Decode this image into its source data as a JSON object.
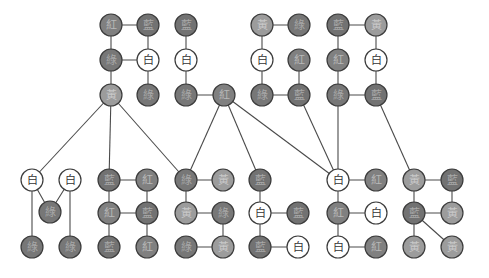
{
  "diagram": {
    "title": "",
    "palette": {
      "白": {
        "fill": "#ffffff",
        "text": "#333333"
      },
      "紅": {
        "fill": "#808080",
        "text": "#b8b8b8"
      },
      "藍": {
        "fill": "#727272",
        "text": "#a8a8a8"
      },
      "綠": {
        "fill": "#777777",
        "text": "#a8a8a8"
      },
      "黃": {
        "fill": "#9c9c9c",
        "text": "#c8c8c8"
      }
    },
    "nodes": [
      {
        "id": "a1",
        "label": "紅",
        "x": 111,
        "y": 25
      },
      {
        "id": "a2",
        "label": "藍",
        "x": 148,
        "y": 25
      },
      {
        "id": "a3",
        "label": "綠",
        "x": 111,
        "y": 60
      },
      {
        "id": "a4",
        "label": "白",
        "x": 148,
        "y": 60
      },
      {
        "id": "a5",
        "label": "黃",
        "x": 111,
        "y": 95
      },
      {
        "id": "a6",
        "label": "綠",
        "x": 148,
        "y": 95
      },
      {
        "id": "b1",
        "label": "藍",
        "x": 186,
        "y": 25
      },
      {
        "id": "b2",
        "label": "白",
        "x": 186,
        "y": 60
      },
      {
        "id": "b3",
        "label": "綠",
        "x": 186,
        "y": 95
      },
      {
        "id": "b4",
        "label": "紅",
        "x": 224,
        "y": 95
      },
      {
        "id": "c1",
        "label": "黃",
        "x": 262,
        "y": 25
      },
      {
        "id": "c2",
        "label": "綠",
        "x": 299,
        "y": 25
      },
      {
        "id": "c3",
        "label": "白",
        "x": 262,
        "y": 60
      },
      {
        "id": "c4",
        "label": "紅",
        "x": 299,
        "y": 60
      },
      {
        "id": "c5",
        "label": "綠",
        "x": 262,
        "y": 95
      },
      {
        "id": "c6",
        "label": "藍",
        "x": 299,
        "y": 95
      },
      {
        "id": "d1",
        "label": "藍",
        "x": 338,
        "y": 25
      },
      {
        "id": "d2",
        "label": "黃",
        "x": 376,
        "y": 25
      },
      {
        "id": "d3",
        "label": "紅",
        "x": 338,
        "y": 60
      },
      {
        "id": "d4",
        "label": "白",
        "x": 376,
        "y": 60
      },
      {
        "id": "d5",
        "label": "綠",
        "x": 338,
        "y": 95
      },
      {
        "id": "d6",
        "label": "藍",
        "x": 376,
        "y": 95
      },
      {
        "id": "e1",
        "label": "白",
        "x": 32,
        "y": 180
      },
      {
        "id": "e2",
        "label": "白",
        "x": 70,
        "y": 180
      },
      {
        "id": "e3",
        "label": "綠",
        "x": 50,
        "y": 212
      },
      {
        "id": "e4",
        "label": "綠",
        "x": 32,
        "y": 247
      },
      {
        "id": "e5",
        "label": "綠",
        "x": 70,
        "y": 247
      },
      {
        "id": "f1",
        "label": "藍",
        "x": 109,
        "y": 180
      },
      {
        "id": "f2",
        "label": "紅",
        "x": 147,
        "y": 180
      },
      {
        "id": "f3",
        "label": "紅",
        "x": 109,
        "y": 213
      },
      {
        "id": "f4",
        "label": "藍",
        "x": 147,
        "y": 213
      },
      {
        "id": "f5",
        "label": "藍",
        "x": 109,
        "y": 247
      },
      {
        "id": "f6",
        "label": "紅",
        "x": 147,
        "y": 247
      },
      {
        "id": "g1",
        "label": "綠",
        "x": 186,
        "y": 180
      },
      {
        "id": "g2",
        "label": "黃",
        "x": 223,
        "y": 180
      },
      {
        "id": "g3",
        "label": "黃",
        "x": 186,
        "y": 213
      },
      {
        "id": "g4",
        "label": "綠",
        "x": 223,
        "y": 213
      },
      {
        "id": "g5",
        "label": "綠",
        "x": 186,
        "y": 247
      },
      {
        "id": "g6",
        "label": "黃",
        "x": 223,
        "y": 247
      },
      {
        "id": "h1",
        "label": "藍",
        "x": 260,
        "y": 180
      },
      {
        "id": "h2",
        "label": "白",
        "x": 260,
        "y": 213
      },
      {
        "id": "h3",
        "label": "藍",
        "x": 298,
        "y": 213
      },
      {
        "id": "h4",
        "label": "藍",
        "x": 260,
        "y": 247
      },
      {
        "id": "h5",
        "label": "白",
        "x": 298,
        "y": 247
      },
      {
        "id": "i1",
        "label": "白",
        "x": 338,
        "y": 180
      },
      {
        "id": "i2",
        "label": "紅",
        "x": 376,
        "y": 180
      },
      {
        "id": "i3",
        "label": "紅",
        "x": 338,
        "y": 213
      },
      {
        "id": "i4",
        "label": "白",
        "x": 376,
        "y": 213
      },
      {
        "id": "i5",
        "label": "白",
        "x": 338,
        "y": 247
      },
      {
        "id": "i6",
        "label": "紅",
        "x": 376,
        "y": 247
      },
      {
        "id": "j1",
        "label": "黃",
        "x": 414,
        "y": 180
      },
      {
        "id": "j2",
        "label": "藍",
        "x": 452,
        "y": 180
      },
      {
        "id": "j3",
        "label": "藍",
        "x": 414,
        "y": 213
      },
      {
        "id": "j4",
        "label": "黃",
        "x": 452,
        "y": 213
      },
      {
        "id": "j5",
        "label": "黃",
        "x": 414,
        "y": 247
      },
      {
        "id": "j6",
        "label": "黃",
        "x": 452,
        "y": 247
      }
    ],
    "edges": [
      [
        "a1",
        "a2"
      ],
      [
        "a1",
        "a3"
      ],
      [
        "a2",
        "a4"
      ],
      [
        "a3",
        "a4"
      ],
      [
        "a3",
        "a5"
      ],
      [
        "a4",
        "a6"
      ],
      [
        "b1",
        "b2"
      ],
      [
        "b2",
        "b3"
      ],
      [
        "b3",
        "b4"
      ],
      [
        "c1",
        "c2"
      ],
      [
        "c1",
        "c3"
      ],
      [
        "c3",
        "c5"
      ],
      [
        "c4",
        "c6"
      ],
      [
        "c5",
        "c6"
      ],
      [
        "d1",
        "d2"
      ],
      [
        "d1",
        "d3"
      ],
      [
        "d3",
        "d5"
      ],
      [
        "d2",
        "d4"
      ],
      [
        "d4",
        "d6"
      ],
      [
        "d5",
        "d6"
      ],
      [
        "e1",
        "e3"
      ],
      [
        "e2",
        "e3"
      ],
      [
        "e1",
        "e4"
      ],
      [
        "e2",
        "e5"
      ],
      [
        "f1",
        "f2"
      ],
      [
        "f1",
        "f3"
      ],
      [
        "f3",
        "f5"
      ],
      [
        "f2",
        "f4"
      ],
      [
        "f4",
        "f6"
      ],
      [
        "f3",
        "f4"
      ],
      [
        "g1",
        "g2"
      ],
      [
        "g1",
        "g3"
      ],
      [
        "g3",
        "g4"
      ],
      [
        "g4",
        "g6"
      ],
      [
        "g5",
        "g6"
      ],
      [
        "h1",
        "h2"
      ],
      [
        "h2",
        "h3"
      ],
      [
        "h2",
        "h4"
      ],
      [
        "h4",
        "h5"
      ],
      [
        "i1",
        "i2"
      ],
      [
        "i1",
        "i3"
      ],
      [
        "i3",
        "i4"
      ],
      [
        "i3",
        "i5"
      ],
      [
        "i5",
        "i6"
      ],
      [
        "j1",
        "j2"
      ],
      [
        "j1",
        "j3"
      ],
      [
        "j2",
        "j4"
      ],
      [
        "j3",
        "j4"
      ],
      [
        "j3",
        "j5"
      ],
      [
        "j3",
        "j6"
      ],
      [
        "a5",
        "e1"
      ],
      [
        "a5",
        "f1"
      ],
      [
        "a5",
        "g1"
      ],
      [
        "b4",
        "g1"
      ],
      [
        "b4",
        "h1"
      ],
      [
        "b4",
        "i1"
      ],
      [
        "c6",
        "i1"
      ],
      [
        "d5",
        "i1"
      ],
      [
        "d6",
        "j1"
      ]
    ]
  }
}
